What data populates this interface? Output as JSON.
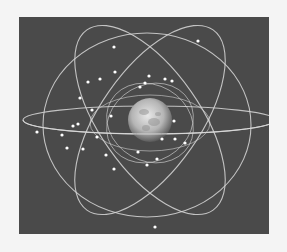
{
  "image": {
    "subject": "satellite-constellation-orbits-around-earth",
    "background_color": "#4a4a4a",
    "page_color": "#f4f4f4",
    "orbit_color": "#d8d8d8",
    "earth": {
      "cx": 131,
      "cy": 103,
      "r": 22
    },
    "orbits": [
      {
        "cx": 130,
        "cy": 103,
        "rx": 126,
        "ry": 14,
        "rot": 0
      },
      {
        "cx": 131,
        "cy": 103,
        "rx": 110,
        "ry": 50,
        "rot": -55
      },
      {
        "cx": 131,
        "cy": 103,
        "rx": 110,
        "ry": 50,
        "rot": 55
      },
      {
        "cx": 128,
        "cy": 108,
        "rx": 104,
        "ry": 92,
        "rot": 0
      },
      {
        "cx": 131,
        "cy": 106,
        "rx": 60,
        "ry": 28,
        "rot": 0
      },
      {
        "cx": 131,
        "cy": 106,
        "rx": 45,
        "ry": 38,
        "rot": 30
      },
      {
        "cx": 131,
        "cy": 106,
        "rx": 45,
        "ry": 38,
        "rot": -30
      }
    ],
    "satellites": [
      [
        114,
        30
      ],
      [
        198,
        24
      ],
      [
        115,
        55
      ],
      [
        100,
        62
      ],
      [
        88,
        65
      ],
      [
        149,
        59
      ],
      [
        165,
        62
      ],
      [
        172,
        64
      ],
      [
        140,
        70
      ],
      [
        145,
        66
      ],
      [
        80,
        81
      ],
      [
        92,
        93
      ],
      [
        111,
        99
      ],
      [
        174,
        104
      ],
      [
        73,
        109
      ],
      [
        78,
        107
      ],
      [
        97,
        120
      ],
      [
        162,
        122
      ],
      [
        175,
        122
      ],
      [
        185,
        126
      ],
      [
        67,
        131
      ],
      [
        83,
        132
      ],
      [
        106,
        138
      ],
      [
        138,
        135
      ],
      [
        157,
        142
      ],
      [
        147,
        148
      ],
      [
        114,
        152
      ],
      [
        155,
        210
      ],
      [
        37,
        115
      ],
      [
        62,
        118
      ]
    ]
  }
}
